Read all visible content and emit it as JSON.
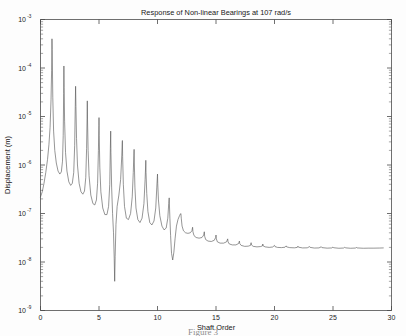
{
  "figure": {
    "caption": "Figure 3"
  },
  "chart_data": {
    "type": "line",
    "title": "Response of Non-linear Bearings at 107 rad/s",
    "xlabel": "Shaft Order",
    "ylabel": "Displacement (m)",
    "xlim": [
      0,
      30
    ],
    "ylim": [
      1e-09,
      0.001
    ],
    "yscale": "log",
    "xscale": "linear",
    "grid": false,
    "legend": null,
    "x_ticks": [
      0,
      5,
      10,
      15,
      20,
      25,
      30
    ],
    "x_tick_labels": [
      "0",
      "5",
      "10",
      "15",
      "20",
      "25",
      "30"
    ],
    "y_ticks": [
      0.001,
      0.0001,
      1e-05,
      1e-06,
      1e-07,
      1e-08,
      1e-09
    ],
    "y_tick_labels": [
      "10",
      "10",
      "10",
      "10",
      "10",
      "10",
      "10"
    ],
    "y_tick_exponents": [
      "-3",
      "-4",
      "-5",
      "-6",
      "-7",
      "-8",
      "-9"
    ],
    "series": [
      {
        "name": "Displacement response",
        "x": [
          0.0,
          0.15,
          0.3,
          0.45,
          0.6,
          0.72,
          0.82,
          0.9,
          0.95,
          0.98,
          1.0,
          1.02,
          1.05,
          1.12,
          1.22,
          1.35,
          1.5,
          1.65,
          1.78,
          1.88,
          1.94,
          1.98,
          2.0,
          2.02,
          2.06,
          2.14,
          2.26,
          2.42,
          2.58,
          2.72,
          2.84,
          2.92,
          2.97,
          3.0,
          3.03,
          3.08,
          3.16,
          3.3,
          3.46,
          3.62,
          3.76,
          3.87,
          3.94,
          3.98,
          4.0,
          4.02,
          4.07,
          4.15,
          4.3,
          4.48,
          4.64,
          4.78,
          4.88,
          4.95,
          4.99,
          5.0,
          5.02,
          5.07,
          5.16,
          5.32,
          5.5,
          5.68,
          5.82,
          5.92,
          5.97,
          6.0,
          6.02,
          6.08,
          6.16,
          6.24,
          6.3,
          6.34,
          6.38,
          6.45,
          6.55,
          6.7,
          6.85,
          6.95,
          6.99,
          7.0,
          7.02,
          7.08,
          7.18,
          7.34,
          7.52,
          7.7,
          7.84,
          7.93,
          7.98,
          8.0,
          8.02,
          8.07,
          8.16,
          8.32,
          8.5,
          8.68,
          8.84,
          8.94,
          8.99,
          9.0,
          9.02,
          9.08,
          9.18,
          9.34,
          9.52,
          9.7,
          9.85,
          9.94,
          9.99,
          10.0,
          10.02,
          10.08,
          10.2,
          10.38,
          10.56,
          10.74,
          10.88,
          10.96,
          11.0,
          11.02,
          11.06,
          11.12,
          11.2,
          11.3,
          11.4,
          11.5,
          11.62,
          11.75,
          11.88,
          11.96,
          12.0,
          12.03,
          12.1,
          12.22,
          12.4,
          12.6,
          12.8,
          12.94,
          13.0,
          13.03,
          13.12,
          13.3,
          13.55,
          13.8,
          13.95,
          14.0,
          14.03,
          14.12,
          14.32,
          14.6,
          14.85,
          14.97,
          15.0,
          15.03,
          15.12,
          15.35,
          15.65,
          15.9,
          16.0,
          16.03,
          16.14,
          16.4,
          16.7,
          16.93,
          17.0,
          17.03,
          17.15,
          17.45,
          17.75,
          17.95,
          18.0,
          18.03,
          18.18,
          18.5,
          18.8,
          18.97,
          19.0,
          19.03,
          19.2,
          19.55,
          19.85,
          20.0,
          20.04,
          20.25,
          20.6,
          20.9,
          21.0,
          21.04,
          21.3,
          21.7,
          21.95,
          22.0,
          22.05,
          22.4,
          22.8,
          23.0,
          23.05,
          23.4,
          23.8,
          24.0,
          24.05,
          24.5,
          24.9,
          25.0,
          25.05,
          25.5,
          25.9,
          26.0,
          26.05,
          26.5,
          26.95,
          27.0,
          27.05,
          27.6,
          28.0,
          28.5,
          29.0,
          29.3
        ],
        "y": [
          2.2e-07,
          2.8e-07,
          4.2e-07,
          7e-07,
          1.3e-06,
          2.6e-06,
          6e-06,
          2.2e-05,
          9e-05,
          0.0004,
          0.00024,
          0.0001,
          2.5e-05,
          5e-06,
          2e-06,
          1.1e-06,
          7.5e-07,
          6.5e-07,
          7.2e-07,
          1.2e-06,
          4e-06,
          3e-05,
          0.00011,
          4e-05,
          8e-06,
          1.8e-06,
          7.5e-07,
          4.5e-07,
          3.8e-07,
          4.2e-07,
          7e-07,
          2.5e-06,
          1.6e-05,
          4.2e-05,
          1.6e-05,
          3.5e-06,
          1e-06,
          4.2e-07,
          2.8e-07,
          2.5e-07,
          2.9e-07,
          5.5e-07,
          2.2e-06,
          9e-06,
          2.1e-05,
          8.5e-06,
          2e-06,
          6e-07,
          2.4e-07,
          1.6e-07,
          1.5e-07,
          1.9e-07,
          4.2e-07,
          2e-06,
          6.5e-06,
          9.5e-06,
          4e-06,
          9e-07,
          2.8e-07,
          1.3e-07,
          9.5e-08,
          9.5e-08,
          1.4e-07,
          4e-07,
          2.2e-06,
          5e-06,
          1.8e-06,
          3.5e-07,
          1e-07,
          4e-08,
          1.2e-08,
          4e-09,
          1.3e-08,
          6e-08,
          1.4e-07,
          2.4e-07,
          5e-07,
          1.6e-06,
          3e-06,
          3.2e-06,
          1.5e-06,
          4e-07,
          1.4e-07,
          8e-08,
          7.5e-08,
          1e-07,
          2.2e-07,
          7e-07,
          1.6e-06,
          2.1e-06,
          1.1e-06,
          3.5e-07,
          1.3e-07,
          7.5e-08,
          6.5e-08,
          8e-08,
          1.6e-07,
          5e-07,
          1e-06,
          1.25e-06,
          7e-07,
          2.6e-07,
          1.1e-07,
          6.5e-08,
          5.8e-08,
          7e-08,
          1.3e-07,
          3.5e-07,
          5.8e-07,
          6.5e-07,
          4.2e-07,
          1.9e-07,
          9e-08,
          5.5e-08,
          4.6e-08,
          5e-08,
          8e-08,
          1.6e-07,
          2.1e-07,
          1.5e-07,
          8e-08,
          3.5e-08,
          1.5e-08,
          1.1e-08,
          1.6e-08,
          3e-08,
          5.5e-08,
          7.5e-08,
          9e-08,
          9.8e-08,
          1e-07,
          8e-08,
          5.5e-08,
          4.4e-08,
          4e-08,
          3.9e-08,
          4e-08,
          4.4e-08,
          5.2e-08,
          4.2e-08,
          3.5e-08,
          3.2e-08,
          3.1e-08,
          3.2e-08,
          3.6e-08,
          4.2e-08,
          3.4e-08,
          2.9e-08,
          2.7e-08,
          2.65e-08,
          2.8e-08,
          3.2e-08,
          3.6e-08,
          3e-08,
          2.6e-08,
          2.45e-08,
          2.45e-08,
          2.6e-08,
          3e-08,
          2.6e-08,
          2.35e-08,
          2.25e-08,
          2.25e-08,
          2.4e-08,
          2.7e-08,
          2.4e-08,
          2.2e-08,
          2.1e-08,
          2.12e-08,
          2.2e-08,
          2.5e-08,
          2.25e-08,
          2.1e-08,
          2.05e-08,
          2.08e-08,
          2.15e-08,
          2.35e-08,
          2.15e-08,
          2.05e-08,
          2e-08,
          2.04e-08,
          2.2e-08,
          2.08e-08,
          2e-08,
          1.98e-08,
          2.02e-08,
          2.15e-08,
          2.05e-08,
          1.98e-08,
          1.96e-08,
          2e-08,
          2.12e-08,
          2.02e-08,
          1.95e-08,
          1.96e-08,
          2.08e-08,
          2e-08,
          1.94e-08,
          1.95e-08,
          2.06e-08,
          1.98e-08,
          1.93e-08,
          1.95e-08,
          2.04e-08,
          1.97e-08,
          1.92e-08,
          1.94e-08,
          2.02e-08,
          1.96e-08,
          1.92e-08,
          1.94e-08,
          2e-08,
          1.95e-08,
          1.92e-08,
          1.93e-08,
          1.93e-08,
          1.94e-08,
          1.95e-08
        ]
      }
    ]
  }
}
